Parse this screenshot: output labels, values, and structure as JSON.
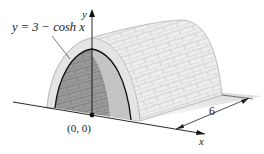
{
  "figure": {
    "curve_label": "y = 3 − cosh x",
    "axis_y_label": "y",
    "axis_x_label": "x",
    "origin_label": "(0, 0)",
    "length_dimension": "6"
  },
  "colors": {
    "outline": "#111111",
    "brick_light": "#ececec",
    "brick_mortar": "#c9c9c9",
    "interior_dark": "#8a8a8a",
    "ground_shadow": "#d6d6d6"
  }
}
